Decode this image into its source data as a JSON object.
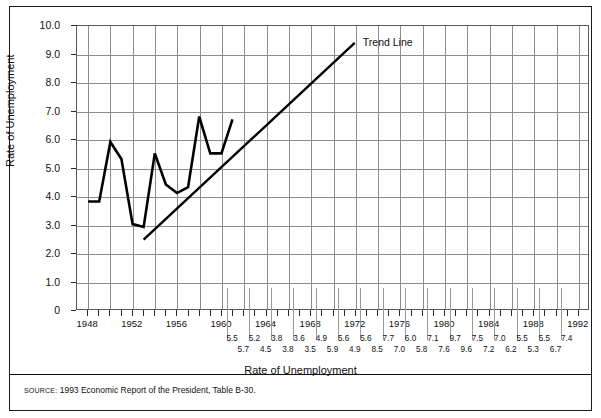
{
  "figure": {
    "trend_label": "Trend Line",
    "x_axis_title": "Rate of Unemployment",
    "y_axis_title": "Rate of Unemployment",
    "source_label": "SOURCE:",
    "source_text": "1993 Economic Report of the President, Table B-30."
  },
  "chart_data": {
    "type": "line",
    "title": "",
    "xlabel": "Rate of Unemployment",
    "ylabel": "Rate of Unemployment",
    "xlim": [
      1947,
      1993
    ],
    "ylim": [
      0,
      10
    ],
    "grid": true,
    "legend": "inline-annotation",
    "y_ticks": [
      "0",
      "1.0",
      "2.0",
      "3.0",
      "4.0",
      "5.0",
      "6.0",
      "7.0",
      "8.0",
      "9.0",
      "10.0"
    ],
    "y_tick_values": [
      0,
      1,
      2,
      3,
      4,
      5,
      6,
      7,
      8,
      9,
      10
    ],
    "x_tick_labels": [
      "1948",
      "1952",
      "1956",
      "1960",
      "1964",
      "1968",
      "1972",
      "1976",
      "1980",
      "1984",
      "1988",
      "1992"
    ],
    "x_tick_values": [
      1948,
      1952,
      1956,
      1960,
      1964,
      1968,
      1972,
      1976,
      1980,
      1984,
      1988,
      1992
    ],
    "series": [
      {
        "name": "Rate of Unemployment",
        "x": [
          1948,
          1949,
          1950,
          1951,
          1952,
          1953,
          1954,
          1955,
          1956,
          1957,
          1958,
          1959,
          1960,
          1961
        ],
        "values": [
          3.8,
          3.8,
          5.9,
          5.3,
          3.0,
          2.9,
          5.5,
          4.4,
          4.1,
          4.3,
          6.8,
          5.5,
          5.5,
          6.7
        ]
      },
      {
        "name": "Trend Line",
        "x": [
          1953,
          1972
        ],
        "values": [
          2.45,
          9.4
        ]
      }
    ],
    "table_rows": [
      {
        "row": "upper",
        "x": [
          1961,
          1963,
          1965,
          1967,
          1969,
          1971,
          1973,
          1975,
          1977,
          1979,
          1981,
          1983,
          1985,
          1987,
          1989,
          1991
        ],
        "values": [
          "5.5",
          "5.2",
          "3.8",
          "3.6",
          "4.9",
          "5.6",
          "5.6",
          "7.7",
          "6.0",
          "7.1",
          "9.7",
          "7.5",
          "7.0",
          "5.5",
          "5.5",
          "7.4"
        ]
      },
      {
        "row": "lower",
        "x": [
          1962,
          1964,
          1966,
          1968,
          1970,
          1972,
          1974,
          1976,
          1978,
          1980,
          1982,
          1984,
          1986,
          1988,
          1990
        ],
        "values": [
          "5.7",
          "4.5",
          "3.8",
          "3.5",
          "5.9",
          "4.9",
          "8.5",
          "7.0",
          "5.8",
          "7.6",
          "9.6",
          "7.2",
          "6.2",
          "5.3",
          "6.7"
        ]
      }
    ]
  }
}
